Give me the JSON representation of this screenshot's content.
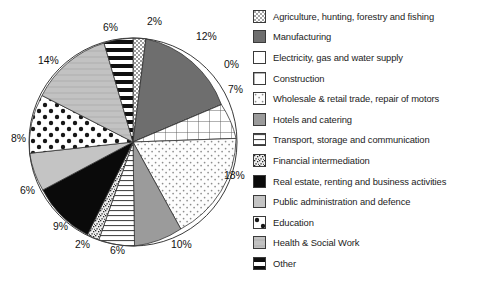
{
  "chart_data": {
    "type": "pie",
    "title": "",
    "legend_position": "right",
    "categories": [
      "Agriculture, hunting, forestry and fishing",
      "Manufacturing",
      "Electricity, gas and water supply",
      "Construction",
      "Wholesale & retail trade, repair of motors",
      "Hotels and catering",
      "Transport, storage and communication",
      "Financial intermediation",
      "Real estate, renting and business activities",
      "Public administration and defence",
      "Education",
      "Health & Social Work",
      "Other"
    ],
    "values": [
      2,
      12,
      0,
      7,
      18,
      10,
      6,
      2,
      9,
      6,
      8,
      14,
      6
    ],
    "data_labels": [
      "2%",
      "12%",
      "0%",
      "7%",
      "18%",
      "10%",
      "6%",
      "2%",
      "9%",
      "6%",
      "8%",
      "14%",
      "6%"
    ],
    "patterns": [
      "checkerboard",
      "solid-dark-gray",
      "white",
      "grid",
      "fine-dots",
      "solid-medium-gray",
      "horizontal-thin-lines",
      "speckle",
      "solid-black",
      "solid-light-gray",
      "large-dots",
      "light-gray-hlines",
      "thick-horizontal-stripes"
    ]
  },
  "legend": {
    "items": [
      {
        "label": "Agriculture, hunting, forestry and fishing",
        "swatch": "checkerboard-swatch"
      },
      {
        "label": "Manufacturing",
        "swatch": "solid-dark-gray-swatch"
      },
      {
        "label": "Electricity, gas and water supply",
        "swatch": "white-swatch"
      },
      {
        "label": "Construction",
        "swatch": "grid-swatch"
      },
      {
        "label": "Wholesale & retail trade, repair of motors",
        "swatch": "fine-dots-swatch"
      },
      {
        "label": "Hotels and catering",
        "swatch": "solid-medium-gray-swatch"
      },
      {
        "label": "Transport, storage and communication",
        "swatch": "horizontal-thin-lines-swatch"
      },
      {
        "label": "Financial intermediation",
        "swatch": "speckle-swatch"
      },
      {
        "label": "Real estate, renting and business activities",
        "swatch": "solid-black-swatch"
      },
      {
        "label": "Public administration and defence",
        "swatch": "solid-light-gray-swatch"
      },
      {
        "label": "Education",
        "swatch": "large-dots-swatch"
      },
      {
        "label": "Health & Social Work",
        "swatch": "light-gray-hlines-swatch"
      },
      {
        "label": "Other",
        "swatch": "thick-horizontal-stripes-swatch"
      }
    ]
  },
  "pie_labels": [
    {
      "text": "2%",
      "x": 147,
      "y": 16
    },
    {
      "text": "12%",
      "x": 196,
      "y": 31
    },
    {
      "text": "0%",
      "x": 224,
      "y": 59
    },
    {
      "text": "7%",
      "x": 228,
      "y": 84
    },
    {
      "text": "18%",
      "x": 224,
      "y": 170
    },
    {
      "text": "10%",
      "x": 171,
      "y": 239
    },
    {
      "text": "6%",
      "x": 110,
      "y": 245
    },
    {
      "text": "2%",
      "x": 75,
      "y": 239
    },
    {
      "text": "9%",
      "x": 53,
      "y": 221
    },
    {
      "text": "6%",
      "x": 20,
      "y": 185
    },
    {
      "text": "8%",
      "x": 11,
      "y": 133
    },
    {
      "text": "14%",
      "x": 38,
      "y": 55
    },
    {
      "text": "6%",
      "x": 103,
      "y": 22
    }
  ]
}
